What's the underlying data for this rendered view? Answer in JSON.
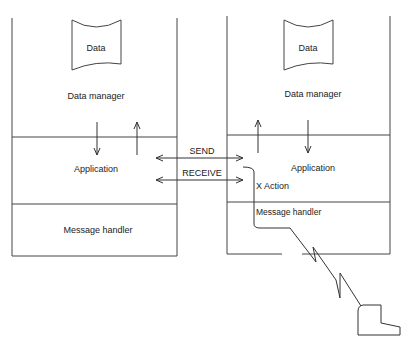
{
  "diagram": {
    "left_node": {
      "data_store": "Data",
      "layers": [
        "Data manager",
        "Application",
        "Message handler"
      ]
    },
    "right_node": {
      "data_store": "Data",
      "layers": [
        "Data manager",
        "Application",
        "Message handler"
      ]
    },
    "connections": {
      "send_label": "SEND",
      "receive_label": "RECEIVE",
      "action_label": "X Action"
    },
    "terminal": "terminal-icon"
  },
  "colors": {
    "line": "#333333",
    "text": "#222222",
    "background": "#ffffff"
  }
}
